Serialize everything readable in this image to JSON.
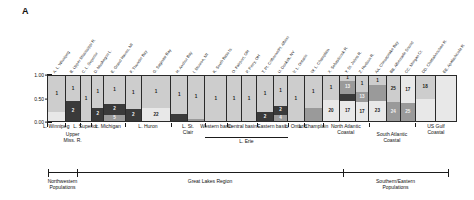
{
  "figure": {
    "panel_letter": "A",
    "type": "stacked-bar-admixture"
  },
  "yaxis": {
    "ticks": [
      "1.00",
      "0.50",
      "0.00"
    ],
    "values": [
      1.0,
      0.5,
      0.0
    ]
  },
  "site_labels": [
    "A. L. Winnipeg",
    "B. Upper Mississippi R.",
    "C. L. Superior",
    "D. Muskegon L.",
    "E. Grand Haven, MI",
    "F. Thunder Bay",
    "G. Saginaw Bay",
    "H. Anchor Bay",
    "I. Monroe, MI",
    "K. South Bass Is.",
    "O. Fairport, OH",
    "P. Perry, OH",
    "T. Pt. Colborne/Pt. Albino",
    "U. Dunkirk, NY",
    "V. L. Ontario",
    "W. L. Champlain",
    "X. Sebasticook R.",
    "Y. St. Johns R.",
    "Z. Hudson R.",
    "AA. Chesapeake Bay",
    "BB. Albemarle Sound",
    "CC. Morgan Cr.",
    "DD. Chattahoochee R.",
    "EE. Apalachicola R."
  ],
  "locality_tier1": [
    {
      "label": "L. Winnipeg"
    },
    {
      "label": "Upper\nMiss. R."
    },
    {
      "label": "L. Superior"
    },
    {
      "label": "L. Michigan"
    },
    {
      "label": "L. Huron"
    },
    {
      "label": "L. St.\nClair"
    },
    {
      "label": "Western basin"
    },
    {
      "label": "Central basin"
    },
    {
      "label": "Eastern basin"
    },
    {
      "label": "L. Ontario"
    },
    {
      "label": "L. Champlain"
    },
    {
      "label": "North Atlantic\nCoastal"
    },
    {
      "label": "South Atlantic\nCoastal"
    },
    {
      "label": "US Gulf\nCoastal"
    }
  ],
  "locality_tier2": [
    {
      "label": "L. Erie"
    }
  ],
  "region_axis": {
    "labels": [
      "Northwestern\nPopulations",
      "Great Lakes Region",
      "Southern/Eastern\nPopulations"
    ]
  },
  "colors": {
    "cluster_light": "#cdcdcd",
    "cluster_mid": "#9a9a9a",
    "cluster_dark": "#3a3a3a",
    "cluster_pale": "#e8e8e8",
    "axis": "#1b1b1b",
    "text": "#111111"
  },
  "chart_data": {
    "type": "bar",
    "title": "",
    "xlabel": "",
    "ylabel": "",
    "ylim": [
      0,
      1
    ],
    "grid": false,
    "legend": "none",
    "categories": [
      "A",
      "B",
      "C",
      "D",
      "E",
      "F",
      "G",
      "H",
      "I",
      "K",
      "O",
      "P",
      "T",
      "U",
      "V",
      "W",
      "X",
      "Y",
      "Z",
      "AA",
      "BB",
      "CC",
      "DD",
      "EE"
    ],
    "bar_widths": [
      18,
      14,
      11,
      11,
      22,
      15,
      30,
      16,
      17,
      22,
      14,
      15,
      16,
      14,
      16,
      18,
      17,
      15,
      13,
      17,
      14,
      14,
      20,
      21
    ],
    "bars": [
      {
        "site": "A",
        "segments": [
          {
            "fraction": 0.8,
            "tone": "light",
            "n": "1"
          },
          {
            "fraction": 0.2,
            "tone": "pale",
            "n": ""
          }
        ]
      },
      {
        "site": "B",
        "segments": [
          {
            "fraction": 0.56,
            "tone": "light",
            "n": "1"
          },
          {
            "fraction": 0.44,
            "tone": "dark",
            "n": "2"
          }
        ]
      },
      {
        "site": "C",
        "segments": [
          {
            "fraction": 1.0,
            "tone": "light",
            "n": "1"
          }
        ]
      },
      {
        "site": "D",
        "segments": [
          {
            "fraction": 0.7,
            "tone": "light",
            "n": "1"
          },
          {
            "fraction": 0.3,
            "tone": "dark",
            "n": "2"
          }
        ]
      },
      {
        "site": "E",
        "segments": [
          {
            "fraction": 0.62,
            "tone": "light",
            "n": "1"
          },
          {
            "fraction": 0.24,
            "tone": "dark",
            "n": "2"
          },
          {
            "fraction": 0.14,
            "tone": "mid",
            "n": "5"
          }
        ]
      },
      {
        "site": "F",
        "segments": [
          {
            "fraction": 0.74,
            "tone": "light",
            "n": "1"
          },
          {
            "fraction": 0.26,
            "tone": "dark",
            "n": "2"
          }
        ]
      },
      {
        "site": "G",
        "segments": [
          {
            "fraction": 0.72,
            "tone": "light",
            "n": "1"
          },
          {
            "fraction": 0.28,
            "tone": "pale",
            "n": "22"
          }
        ]
      },
      {
        "site": "H",
        "segments": [
          {
            "fraction": 0.84,
            "tone": "light",
            "n": "1"
          },
          {
            "fraction": 0.16,
            "tone": "dark",
            "n": ""
          }
        ]
      },
      {
        "site": "I",
        "segments": [
          {
            "fraction": 0.95,
            "tone": "light",
            "n": "1"
          },
          {
            "fraction": 0.05,
            "tone": "mid",
            "n": ""
          }
        ]
      },
      {
        "site": "K",
        "segments": [
          {
            "fraction": 1.0,
            "tone": "light",
            "n": "1"
          }
        ]
      },
      {
        "site": "O",
        "segments": [
          {
            "fraction": 1.0,
            "tone": "light",
            "n": "1"
          }
        ]
      },
      {
        "site": "P",
        "segments": [
          {
            "fraction": 1.0,
            "tone": "light",
            "n": "1"
          }
        ]
      },
      {
        "site": "T",
        "segments": [
          {
            "fraction": 0.8,
            "tone": "light",
            "n": "1"
          },
          {
            "fraction": 0.2,
            "tone": "dark",
            "n": "2"
          }
        ]
      },
      {
        "site": "U",
        "segments": [
          {
            "fraction": 0.66,
            "tone": "light",
            "n": "1"
          },
          {
            "fraction": 0.2,
            "tone": "dark",
            "n": "2"
          },
          {
            "fraction": 0.14,
            "tone": "mid",
            "n": "4"
          }
        ]
      },
      {
        "site": "V",
        "segments": [
          {
            "fraction": 1.0,
            "tone": "light",
            "n": "1"
          }
        ]
      },
      {
        "site": "W",
        "segments": [
          {
            "fraction": 0.7,
            "tone": "light",
            "n": "1"
          },
          {
            "fraction": 0.3,
            "tone": "mid",
            "n": ""
          }
        ]
      },
      {
        "site": "X",
        "segments": [
          {
            "fraction": 0.54,
            "tone": "light",
            "n": "1"
          },
          {
            "fraction": 0.46,
            "tone": "pale",
            "n": "20"
          }
        ]
      },
      {
        "site": "Y",
        "segments": [
          {
            "fraction": 0.1,
            "tone": "light",
            "n": "1"
          },
          {
            "fraction": 0.3,
            "tone": "mid",
            "n": "13"
          },
          {
            "fraction": 0.16,
            "tone": "dark",
            "n": ""
          },
          {
            "fraction": 0.44,
            "tone": "pale",
            "n": "17"
          }
        ]
      },
      {
        "site": "Z",
        "segments": [
          {
            "fraction": 0.36,
            "tone": "light",
            "n": "1"
          },
          {
            "fraction": 0.22,
            "tone": "mid",
            "n": "13"
          },
          {
            "fraction": 0.42,
            "tone": "pale",
            "n": "17"
          }
        ]
      },
      {
        "site": "AA",
        "segments": [
          {
            "fraction": 0.2,
            "tone": "light",
            "n": "1"
          },
          {
            "fraction": 0.36,
            "tone": "mid",
            "n": ""
          },
          {
            "fraction": 0.44,
            "tone": "pale",
            "n": "23"
          }
        ]
      },
      {
        "site": "BB",
        "segments": [
          {
            "fraction": 0.58,
            "tone": "light",
            "n": "25"
          },
          {
            "fraction": 0.42,
            "tone": "mid",
            "n": "24"
          }
        ]
      },
      {
        "site": "CC",
        "segments": [
          {
            "fraction": 0.6,
            "tone": "pale",
            "n": "17"
          },
          {
            "fraction": 0.4,
            "tone": "mid",
            "n": "25"
          }
        ]
      },
      {
        "site": "DD",
        "segments": [
          {
            "fraction": 0.5,
            "tone": "light",
            "n": "18"
          },
          {
            "fraction": 0.5,
            "tone": "pale",
            "n": ""
          }
        ]
      },
      {
        "site": "EE",
        "segments": [
          {
            "fraction": 1.0,
            "tone": "pale",
            "n": ""
          }
        ]
      }
    ]
  }
}
